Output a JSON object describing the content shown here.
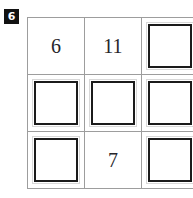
{
  "problem": {
    "badge_number": "6",
    "badge_color": "#121212",
    "badge_text_color": "#ffffff"
  },
  "grid": {
    "rows": 3,
    "columns": 3,
    "line_color": "#9d9d9d",
    "box_color": "#1b1b1b",
    "number_color": "#26252a",
    "cells": [
      {
        "id": "r1c1",
        "type": "number",
        "value": "6"
      },
      {
        "id": "r1c2",
        "type": "number",
        "value": "11"
      },
      {
        "id": "r1c3",
        "type": "answer-box",
        "value": ""
      },
      {
        "id": "r2c1",
        "type": "answer-box",
        "value": ""
      },
      {
        "id": "r2c2",
        "type": "answer-box",
        "value": ""
      },
      {
        "id": "r2c3",
        "type": "answer-box",
        "value": ""
      },
      {
        "id": "r3c1",
        "type": "answer-box",
        "value": ""
      },
      {
        "id": "r3c2",
        "type": "number",
        "value": "7"
      },
      {
        "id": "r3c3",
        "type": "answer-box",
        "value": ""
      }
    ]
  }
}
